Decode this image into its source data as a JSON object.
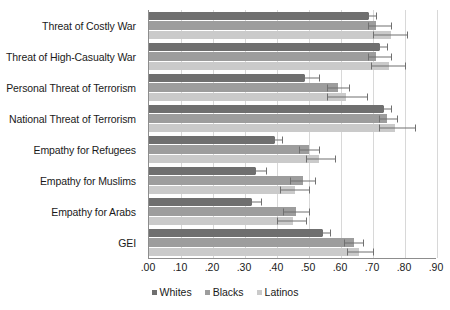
{
  "chart_data": {
    "type": "bar",
    "orientation": "horizontal",
    "title": "",
    "xlabel": "",
    "ylabel": "",
    "xlim": [
      0.0,
      0.9
    ],
    "grid": true,
    "legend_position": "bottom",
    "categories": [
      "Threat of Costly War",
      "Threat of High-Casualty War",
      "Personal Threat of Terrorism",
      "National Threat of Terrorism",
      "Empathy for Refugees",
      "Empathy for Muslims",
      "Empathy for Arabs",
      "GEI"
    ],
    "xticks": [
      0.0,
      0.1,
      0.2,
      0.3,
      0.4,
      0.5,
      0.6,
      0.7,
      0.8,
      0.9
    ],
    "xticklabels": [
      ".00",
      ".10",
      ".20",
      ".30",
      ".40",
      ".50",
      ".60",
      ".70",
      ".80",
      ".90"
    ],
    "series": [
      {
        "name": "Whites",
        "color": "#6f6f6f",
        "values": [
          0.685,
          0.72,
          0.485,
          0.73,
          0.39,
          0.33,
          0.32,
          0.54
        ],
        "err_low": [
          0.685,
          0.72,
          0.485,
          0.73,
          0.39,
          0.33,
          0.32,
          0.54
        ],
        "err_high": [
          0.71,
          0.745,
          0.53,
          0.755,
          0.415,
          0.365,
          0.35,
          0.565
        ]
      },
      {
        "name": "Blacks",
        "color": "#9d9d9d",
        "values": [
          0.71,
          0.71,
          0.59,
          0.745,
          0.5,
          0.48,
          0.46,
          0.64
        ],
        "err_low": [
          0.685,
          0.685,
          0.555,
          0.72,
          0.47,
          0.44,
          0.42,
          0.61
        ],
        "err_high": [
          0.755,
          0.755,
          0.625,
          0.775,
          0.53,
          0.52,
          0.5,
          0.67
        ]
      },
      {
        "name": "Latinos",
        "color": "#cacaca",
        "values": [
          0.755,
          0.75,
          0.615,
          0.77,
          0.53,
          0.455,
          0.45,
          0.655
        ],
        "err_low": [
          0.7,
          0.695,
          0.555,
          0.72,
          0.49,
          0.41,
          0.4,
          0.62
        ],
        "err_high": [
          0.805,
          0.8,
          0.68,
          0.83,
          0.58,
          0.5,
          0.49,
          0.7
        ]
      }
    ]
  },
  "legend": {
    "items": [
      {
        "label": "Whites",
        "color": "#6f6f6f"
      },
      {
        "label": "Blacks",
        "color": "#9d9d9d"
      },
      {
        "label": "Latinos",
        "color": "#cacaca"
      }
    ]
  }
}
